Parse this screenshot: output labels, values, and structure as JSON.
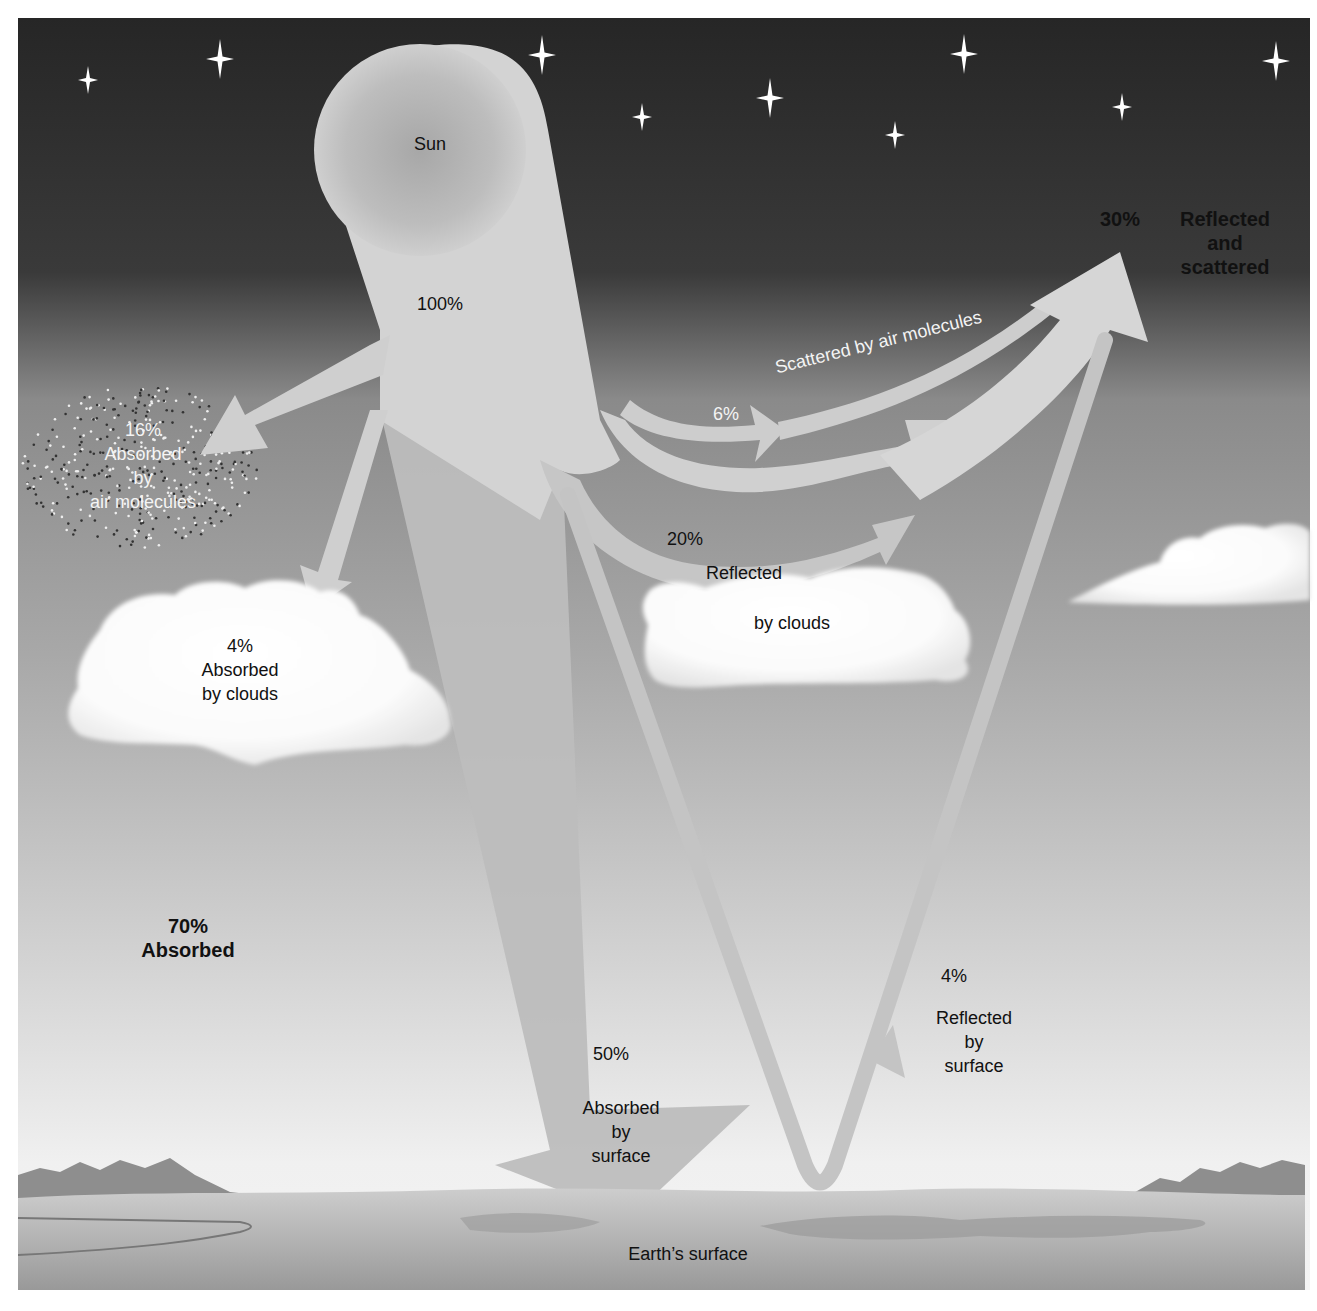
{
  "diagram": {
    "colors": {
      "sky_top": "#2b2b2b",
      "sky_bottom": "#e9e9e9",
      "arrow_fill": "#d2d2d2",
      "arrow_shadow": "#9a9a9a",
      "cloud": "#ffffff",
      "ground": "#a9a9a9",
      "label_dark": "#111111",
      "label_light": "#f4f4f4"
    },
    "sun": {
      "label": "Sun",
      "percent": "100%"
    },
    "reflected_total": {
      "percent": "30%",
      "lines": [
        "Reflected",
        "and",
        "scattered"
      ]
    },
    "absorbed_total": {
      "percent": "70%",
      "label": "Absorbed"
    },
    "air_absorption": {
      "percent": "16%",
      "lines": [
        "Absorbed",
        "by",
        "air molecules"
      ]
    },
    "cloud_absorption": {
      "percent": "4%",
      "lines": [
        "Absorbed",
        "by clouds"
      ]
    },
    "air_scatter": {
      "percent": "6%",
      "label": "Scattered by air molecules"
    },
    "cloud_reflection": {
      "percent": "20%",
      "line1": "Reflected",
      "line2": "by clouds"
    },
    "surface_reflection": {
      "percent": "4%",
      "lines": [
        "Reflected",
        "by",
        "surface"
      ]
    },
    "surface_absorption": {
      "percent": "50%",
      "lines": [
        "Absorbed",
        "by",
        "surface"
      ]
    },
    "ground": {
      "label": "Earth’s surface"
    },
    "budget": [
      {
        "name": "Absorbed by air molecules",
        "percent": 16
      },
      {
        "name": "Absorbed by clouds",
        "percent": 4
      },
      {
        "name": "Absorbed by surface",
        "percent": 50
      },
      {
        "name": "Scattered by air molecules",
        "percent": 6
      },
      {
        "name": "Reflected by clouds",
        "percent": 20
      },
      {
        "name": "Reflected by surface",
        "percent": 4
      }
    ]
  }
}
